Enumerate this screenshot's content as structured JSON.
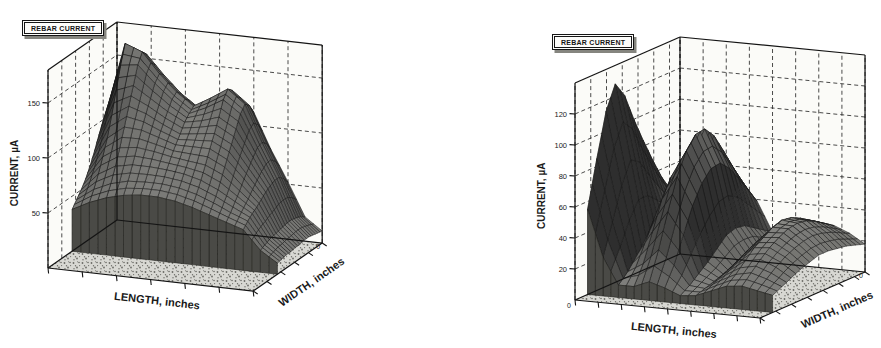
{
  "chart_data": [
    {
      "type": "surface",
      "id": "left",
      "legend_label": "REBAR CURRENT",
      "xlabel": "LENGTH, inches",
      "ylabel": "WIDTH, inches",
      "zlabel": "CURRENT, µA",
      "x_range": [
        0,
        12
      ],
      "y_range": [
        0,
        10
      ],
      "z_range": [
        0,
        180
      ],
      "z_ticks": [
        50,
        100,
        150
      ],
      "z_tick_labels": [
        "50",
        "100",
        "150"
      ],
      "x_tick_step": 2,
      "y_tick_step": 2,
      "grid": "dashed",
      "legend_position": "top-left",
      "corner_labels": {
        "origin": "",
        "width_far": "0"
      },
      "surface_z_by_width_row": [
        [
          38,
          46,
          52,
          56,
          58,
          58,
          56,
          52,
          47,
          42,
          37,
          20,
          10
        ],
        [
          44,
          55,
          62,
          66,
          67,
          67,
          65,
          61,
          55,
          48,
          42,
          22,
          11
        ],
        [
          50,
          66,
          75,
          78,
          78,
          77,
          75,
          71,
          64,
          55,
          46,
          24,
          12
        ],
        [
          57,
          79,
          89,
          91,
          89,
          86,
          84,
          82,
          75,
          62,
          49,
          25,
          12
        ],
        [
          66,
          93,
          105,
          104,
          99,
          94,
          94,
          94,
          86,
          70,
          53,
          26,
          13
        ],
        [
          77,
          111,
          121,
          116,
          108,
          101,
          103,
          105,
          97,
          77,
          57,
          27,
          13
        ],
        [
          89,
          131,
          137,
          127,
          117,
          109,
          112,
          117,
          108,
          84,
          60,
          28,
          14
        ],
        [
          100,
          151,
          153,
          138,
          125,
          114,
          121,
          130,
          119,
          90,
          62,
          28,
          14
        ],
        [
          109,
          168,
          162,
          144,
          129,
          118,
          127,
          137,
          125,
          92,
          62,
          27,
          13
        ],
        [
          104,
          162,
          157,
          140,
          125,
          114,
          123,
          133,
          121,
          88,
          58,
          25,
          12
        ],
        [
          93,
          146,
          144,
          130,
          117,
          108,
          115,
          124,
          112,
          80,
          52,
          22,
          11
        ]
      ],
      "layout": {
        "origin": [
          48,
          268
        ],
        "L_vec": [
          17.1,
          1.92
        ],
        "W_vec": [
          6.9,
          -4.8
        ],
        "z_px_per_unit": 1.1,
        "y_inset": 3.5,
        "colors": {
          "wall": "#fbfbf8",
          "floor_bg": "#d8d8d3",
          "floor_dot": "#6b6b66",
          "skirt_bg": "#b3b3ae",
          "skirt_mark": "#55504c",
          "surface_light": "#8c8c88",
          "surface_dark": "#2e2e2e",
          "front_skirt": "#4a4a46",
          "line": "#141414"
        }
      }
    },
    {
      "type": "surface",
      "id": "right",
      "legend_label": "REBAR CURRENT",
      "xlabel": "LENGTH, inches",
      "ylabel": "WIDTH, inches",
      "zlabel": "CURRENT, µA",
      "x_range": [
        0,
        12
      ],
      "y_range": [
        0,
        10
      ],
      "z_range": [
        0,
        140
      ],
      "z_ticks": [
        20,
        40,
        60,
        80,
        100,
        120
      ],
      "z_tick_labels": [
        "20",
        "40",
        "60",
        "80",
        "100",
        "120"
      ],
      "x_tick_step": 1.5,
      "y_tick_step": 1.5,
      "grid": "dashed",
      "legend_position": "top-left",
      "corner_labels": {
        "origin": "0",
        "width_far": "0"
      },
      "surface_z_by_width_row": [
        [
          55,
          25,
          8,
          8,
          12,
          9,
          5,
          6,
          10,
          14,
          15,
          13,
          11
        ],
        [
          85,
          45,
          14,
          20,
          30,
          21,
          9,
          8,
          14,
          19,
          21,
          18,
          14
        ],
        [
          113,
          66,
          22,
          38,
          52,
          38,
          14,
          10,
          18,
          25,
          27,
          23,
          17
        ],
        [
          128,
          80,
          30,
          56,
          72,
          54,
          19,
          12,
          22,
          31,
          32,
          27,
          20
        ],
        [
          118,
          76,
          34,
          68,
          86,
          66,
          25,
          15,
          26,
          35,
          36,
          30,
          22
        ],
        [
          100,
          65,
          34,
          74,
          94,
          73,
          31,
          18,
          29,
          39,
          39,
          32,
          24
        ],
        [
          84,
          55,
          31,
          73,
          95,
          74,
          33,
          19,
          31,
          41,
          40,
          33,
          24
        ],
        [
          69,
          46,
          27,
          65,
          88,
          68,
          32,
          19,
          31,
          40,
          39,
          32,
          23
        ],
        [
          55,
          38,
          23,
          55,
          76,
          59,
          28,
          17,
          29,
          37,
          36,
          30,
          22
        ],
        [
          44,
          31,
          19,
          45,
          63,
          49,
          24,
          15,
          26,
          33,
          32,
          27,
          20
        ],
        [
          34,
          25,
          15,
          36,
          50,
          39,
          20,
          13,
          23,
          29,
          28,
          24,
          18
        ]
      ],
      "layout": {
        "origin": [
          575,
          300
        ],
        "L_vec": [
          15.42,
          1.5
        ],
        "W_vec": [
          10.5,
          -4.6
        ],
        "z_px_per_unit": 1.55,
        "y_inset": 1.2,
        "colors": {
          "wall": "#fbfbf8",
          "floor_bg": "#d8d8d3",
          "floor_dot": "#6b6b66",
          "skirt_bg": "#b3b3ae",
          "skirt_mark": "#55504c",
          "surface_light": "#8c8c88",
          "surface_dark": "#2e2e2e",
          "front_skirt": "#4a4a46",
          "line": "#141414"
        }
      }
    }
  ]
}
